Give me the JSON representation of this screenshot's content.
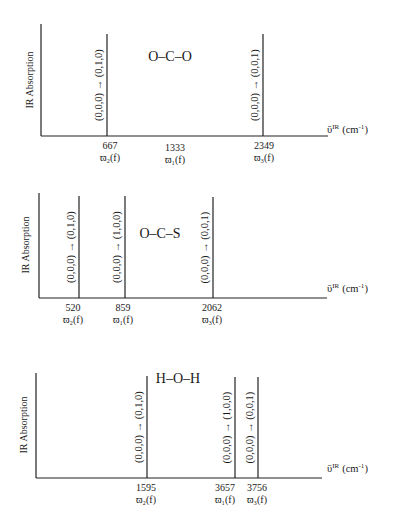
{
  "diagram": {
    "y_axis_label": "IR Absorption",
    "x_axis_label": "ῡᴵᴿ (cm⁻¹)",
    "x_axis_label_parts": {
      "symbol": "ῡ",
      "superscript": "IR",
      "unit": "(cm",
      "unit_exp": "-1",
      "close": ")"
    },
    "panels": [
      {
        "molecule": "O–C–O",
        "axis": {
          "x0": 41,
          "y_top": 24,
          "y_axis": 136,
          "x_end": 328
        },
        "mol_pos": {
          "x": 170,
          "y": 61
        },
        "xlabel_pos": {
          "x": 327,
          "y": 133
        },
        "ylabel_pos": {
          "x": 33,
          "y": 80
        },
        "peaks": [
          {
            "x": 107,
            "top": 34,
            "transition": "(0,0,0) → (0,1,0)",
            "wavenumber": "667",
            "mode": "ϖ₂(f)",
            "label_x": 110
          },
          {
            "x": 263,
            "top": 34,
            "transition": "(0,0,0) → (0,0,1)",
            "wavenumber": "2349",
            "mode": "ϖ₃(f)",
            "label_x": 264
          }
        ],
        "extra_labels": [
          {
            "wavenumber": "1333",
            "mode": "ϖ₁(f)",
            "label_x": 175
          }
        ]
      },
      {
        "molecule": "O–C–S",
        "axis": {
          "x0": 39,
          "y_top": 193,
          "y_axis": 298,
          "x_end": 327
        },
        "mol_pos": {
          "x": 160,
          "y": 238
        },
        "xlabel_pos": {
          "x": 327,
          "y": 292
        },
        "ylabel_pos": {
          "x": 29,
          "y": 245
        },
        "peaks": [
          {
            "x": 79,
            "top": 196,
            "transition": "(0,0,0) → (0,1,0)",
            "wavenumber": "520",
            "mode": "ϖ₂(f)",
            "label_x": 73
          },
          {
            "x": 125,
            "top": 196,
            "transition": "(0,0,0) → (1,0,0)",
            "wavenumber": "859",
            "mode": "ϖ₁(f)",
            "label_x": 123
          },
          {
            "x": 213,
            "top": 197,
            "transition": "(0,0,0) → (0,0,1)",
            "wavenumber": "2062",
            "mode": "ϖ₃(f)",
            "label_x": 212
          }
        ],
        "extra_labels": []
      },
      {
        "molecule": "H–O–H",
        "axis": {
          "x0": 36,
          "y_top": 373,
          "y_axis": 478,
          "x_end": 322
        },
        "mol_pos": {
          "x": 178,
          "y": 383
        },
        "xlabel_pos": {
          "x": 327,
          "y": 472
        },
        "ylabel_pos": {
          "x": 27,
          "y": 425
        },
        "peaks": [
          {
            "x": 147,
            "top": 376,
            "transition": "(0,0,0) → (0,1,0)",
            "wavenumber": "1595",
            "mode": "ϖ₂(f)",
            "label_x": 146
          },
          {
            "x": 235,
            "top": 377,
            "transition": "(0,0,0) → (1,0,0)",
            "wavenumber": "3657",
            "mode": "ϖ₁(f)",
            "label_x": 225
          },
          {
            "x": 258,
            "top": 377,
            "transition": "(0,0,0) → (0,0,1)",
            "wavenumber": "3756",
            "mode": "ϖ₃(f)",
            "label_x": 257
          }
        ],
        "extra_labels": []
      }
    ],
    "colors": {
      "ink": "#222222",
      "background": "#ffffff"
    }
  }
}
